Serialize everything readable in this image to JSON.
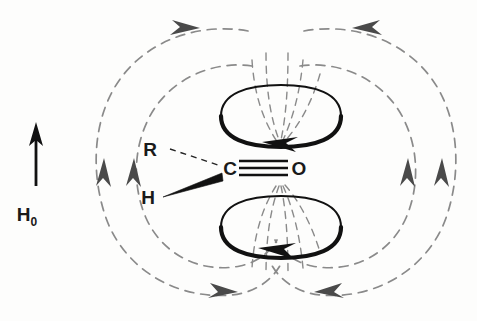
{
  "figure": {
    "background_color": "#fdfdfc"
  },
  "external_field": {
    "label": "H",
    "subscript": "0",
    "full_label": "H0",
    "direction": "up",
    "arrow_color": "#111111"
  },
  "molecule": {
    "atoms": [
      {
        "id": "carbon",
        "label": "C"
      },
      {
        "id": "oxygen",
        "label": "O"
      }
    ],
    "substituents": [
      {
        "id": "r-group",
        "label": "R",
        "bond_style": "dashed-hash",
        "bond_meaning": "behind-plane"
      },
      {
        "id": "hydrogen",
        "label": "H",
        "bond_style": "solid-wedge",
        "bond_meaning": "in-front-of-plane"
      }
    ],
    "bond": {
      "between": "C-O",
      "line_count": 3,
      "style": "triple-line",
      "color": "#111111"
    },
    "label_color": "#1a1a1a"
  },
  "ring_currents": [
    {
      "id": "upper-lobe",
      "position": "above-carbonyl",
      "shape": "ellipse",
      "stroke_color": "#111111",
      "arrow_direction": "clockwise-viewed-from-above",
      "arrow_points": "right"
    },
    {
      "id": "lower-lobe",
      "position": "below-carbonyl",
      "shape": "ellipse",
      "stroke_color": "#111111",
      "arrow_direction": "clockwise-viewed-from-above",
      "arrow_points": "right"
    }
  ],
  "induced_field": {
    "style": "dashed",
    "color": "#8a8a8a",
    "description": "Induced magnetic field lines looping around the ring current lobes",
    "loops": [
      {
        "side": "left",
        "rank": "outer",
        "flow": "counterclockwise"
      },
      {
        "side": "left",
        "rank": "inner",
        "flow": "counterclockwise"
      },
      {
        "side": "right",
        "rank": "inner",
        "flow": "clockwise"
      },
      {
        "side": "right",
        "rank": "outer",
        "flow": "clockwise"
      }
    ],
    "arrowheads": [
      {
        "id": "top-left",
        "points": "right"
      },
      {
        "id": "top-right",
        "points": "left"
      },
      {
        "id": "left-outer-mid",
        "points": "up"
      },
      {
        "id": "left-inner-mid",
        "points": "up"
      },
      {
        "id": "right-inner-mid",
        "points": "up"
      },
      {
        "id": "right-outer-mid",
        "points": "up"
      },
      {
        "id": "bottom-left",
        "points": "left"
      },
      {
        "id": "bottom-right",
        "points": "right"
      }
    ]
  }
}
